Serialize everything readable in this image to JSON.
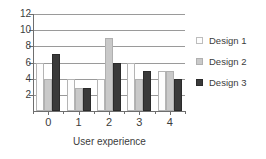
{
  "chart_data": {
    "type": "bar",
    "title": "",
    "subtitle": "",
    "xlabel": "User experience",
    "ylabel": "",
    "categories": [
      "0",
      "1",
      "2",
      "3",
      "4"
    ],
    "series": [
      {
        "name": "Design 1",
        "color": "#fdfdfd",
        "values": [
          6,
          4,
          4,
          6,
          5
        ]
      },
      {
        "name": "Design 2",
        "color": "#c9c9c9",
        "values": [
          4,
          2.8,
          9,
          4,
          5
        ]
      },
      {
        "name": "Design 3",
        "color": "#3a3a3a",
        "values": [
          7,
          2.8,
          6,
          5,
          4
        ]
      }
    ],
    "ylim": [
      0,
      12
    ],
    "yticks": [
      2,
      4,
      6,
      8,
      10,
      12
    ],
    "xticks": [
      "0",
      "1",
      "2",
      "3",
      "4"
    ],
    "grid": true,
    "legend_position": "right",
    "annotations": []
  },
  "legend": {
    "entries": [
      {
        "label": "Design 1"
      },
      {
        "label": "Design 2"
      },
      {
        "label": "Design 3"
      }
    ]
  },
  "axes": {
    "y_tick_labels": [
      "2",
      "4",
      "6",
      "8",
      "10",
      "12"
    ],
    "x_tick_labels": [
      "0",
      "1",
      "2",
      "3",
      "4"
    ],
    "x_title": "User experience"
  }
}
